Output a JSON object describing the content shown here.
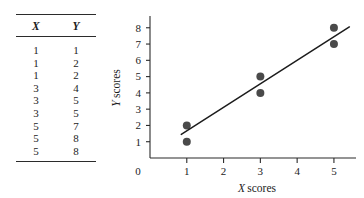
{
  "table": {
    "columns": [
      "X",
      "Y"
    ],
    "rows": [
      [
        "1",
        "1"
      ],
      [
        "1",
        "2"
      ],
      [
        "1",
        "2"
      ],
      [
        "3",
        "4"
      ],
      [
        "3",
        "5"
      ],
      [
        "3",
        "5"
      ],
      [
        "5",
        "7"
      ],
      [
        "5",
        "8"
      ],
      [
        "5",
        "8"
      ]
    ]
  },
  "chart_data": {
    "type": "scatter",
    "title": "",
    "xlabel": "X scores",
    "ylabel": "Y scores",
    "xlabel_italic_prefix": "X",
    "xlabel_rest": "scores",
    "ylabel_italic_prefix": "Y",
    "ylabel_rest": "scores",
    "xlim": [
      0,
      5.6
    ],
    "ylim": [
      0,
      8.6
    ],
    "xticks": [
      1,
      2,
      3,
      4,
      5
    ],
    "xticklabels": [
      "1",
      "2",
      "3",
      "4",
      "5"
    ],
    "yticks": [
      1,
      2,
      3,
      4,
      5,
      6,
      7,
      8
    ],
    "yticklabels": [
      "1",
      "2",
      "3",
      "4",
      "5",
      "6",
      "7",
      "8"
    ],
    "origin_label": "0",
    "grid": false,
    "legend": null,
    "x": [
      1,
      1,
      1,
      3,
      3,
      3,
      5,
      5,
      5
    ],
    "y": [
      1,
      2,
      2,
      4,
      5,
      5,
      7,
      8,
      8
    ],
    "visible_markers": [
      {
        "x": 1,
        "y": 1,
        "n": 1
      },
      {
        "x": 1,
        "y": 2,
        "n": 2
      },
      {
        "x": 3,
        "y": 4,
        "n": 1
      },
      {
        "x": 3,
        "y": 5,
        "n": 2
      },
      {
        "x": 5,
        "y": 7,
        "n": 1
      },
      {
        "x": 5,
        "y": 8,
        "n": 2
      }
    ],
    "marker_color": "#4a4a4a",
    "marker_size_px": 5.2,
    "regression_line": {
      "x0": 0.85,
      "y0": 1.45,
      "x1": 5.42,
      "y1": 8.05,
      "color": "#1c1c1c"
    }
  }
}
